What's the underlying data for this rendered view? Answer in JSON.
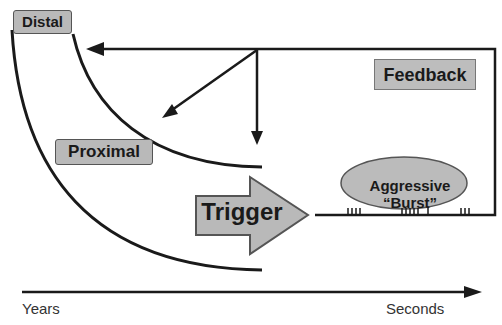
{
  "diagram": {
    "labels": {
      "distal": "Distal",
      "proximal": "Proximal",
      "feedback": "Feedback",
      "trigger": "Trigger",
      "burst_line1": "Aggressive",
      "burst_line2": "“Burst”"
    },
    "axis": {
      "left": "Years",
      "right": "Seconds"
    },
    "burst_tick_groups": [
      4,
      6,
      3
    ],
    "colors": {
      "box_fill": "#b9b9b9",
      "line": "#1a1a1a",
      "ellipse_fill": "#bbbbbb",
      "background": "#ffffff"
    }
  }
}
